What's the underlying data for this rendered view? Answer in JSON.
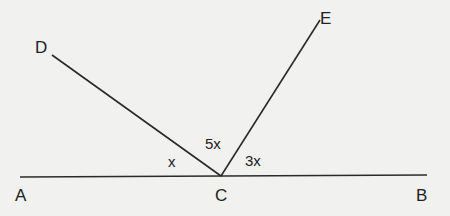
{
  "diagram": {
    "type": "geometry-angles",
    "points": {
      "A": {
        "label": "A"
      },
      "B": {
        "label": "B"
      },
      "C": {
        "label": "C"
      },
      "D": {
        "label": "D"
      },
      "E": {
        "label": "E"
      }
    },
    "segments": [
      "AB",
      "CD",
      "CE"
    ],
    "angles": {
      "ACD": {
        "label": "x"
      },
      "DCE": {
        "label": "5x"
      },
      "ECB": {
        "label": "3x"
      }
    },
    "colors": {
      "line": "#2a2a2a",
      "background": "#f1f1ef"
    }
  }
}
